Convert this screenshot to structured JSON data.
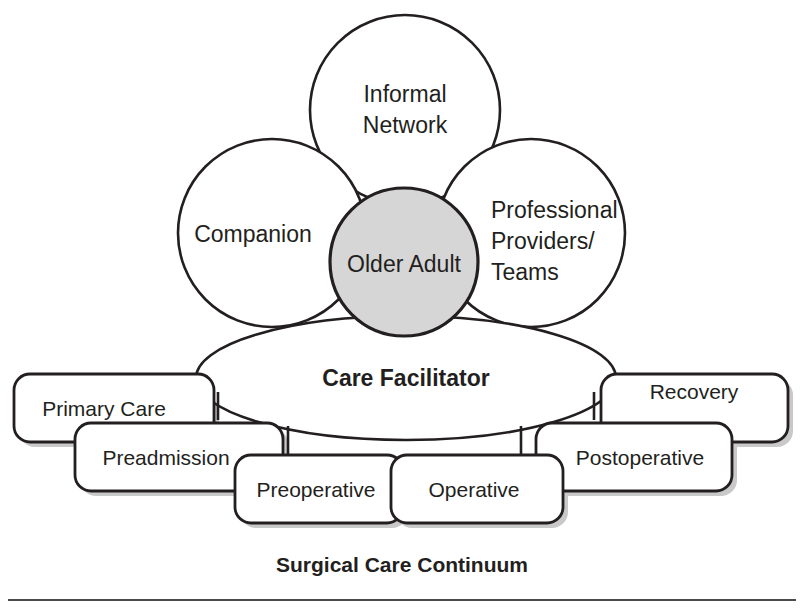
{
  "figure": {
    "caption": "Surgical Care Continuum",
    "center_node": {
      "label": "Older Adult",
      "fill_color": "#d6d6d6"
    },
    "facilitator": {
      "label": "Care Facilitator"
    },
    "support_circles": [
      {
        "id": "informal-network",
        "label_line1": "Informal",
        "label_line2": "Network"
      },
      {
        "id": "companion",
        "label_line1": "Companion",
        "label_line2": ""
      },
      {
        "id": "professional-providers",
        "label_line1": "Professional",
        "label_line2": "Providers/",
        "label_line3": "Teams"
      }
    ],
    "continuum_boxes": [
      {
        "id": "primary-care",
        "label": "Primary Care"
      },
      {
        "id": "preadmission",
        "label": "Preadmission"
      },
      {
        "id": "preoperative",
        "label": "Preoperative"
      },
      {
        "id": "operative",
        "label": "Operative"
      },
      {
        "id": "postoperative",
        "label": "Postoperative"
      },
      {
        "id": "recovery",
        "label": "Recovery"
      }
    ],
    "colors": {
      "line": "#231f20",
      "background": "#ffffff",
      "center_fill": "#d6d6d6",
      "rule": "#4a4a4a"
    }
  }
}
